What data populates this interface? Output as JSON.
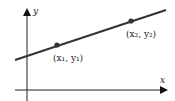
{
  "diagram": {
    "x_axis_label": "x",
    "y_axis_label": "y",
    "point1": {
      "label": "(x₁, y₁)"
    },
    "point2": {
      "label": "(x₂, y₂)"
    },
    "colors": {
      "line": "#333333",
      "axis": "#222222",
      "point": "#333333"
    }
  }
}
